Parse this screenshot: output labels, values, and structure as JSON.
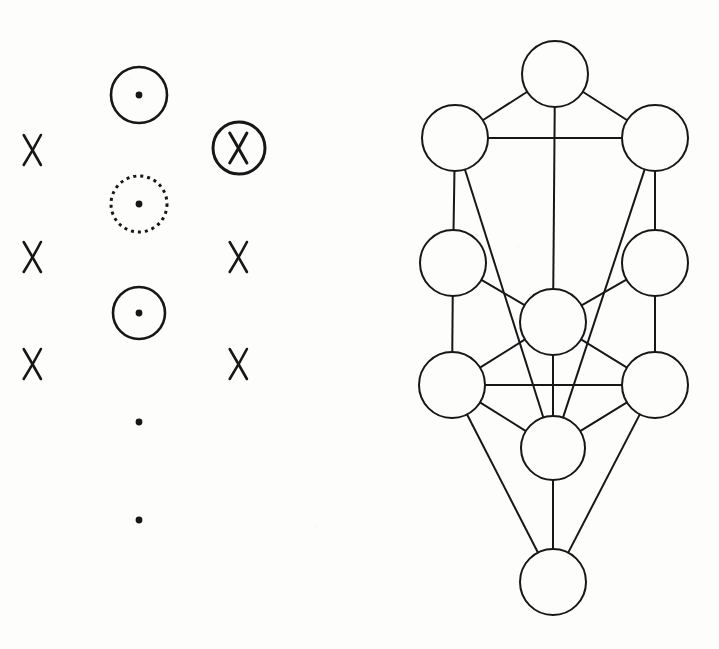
{
  "document": {
    "title": "Esoteric symbol column and Tree of Life diagram",
    "background_color": "#fdfdfb",
    "ink_color": "#17171a",
    "width": 719,
    "height": 649
  },
  "left_panel": {
    "name": "symbol-column-panel",
    "description": "Three vertical columns of alchemical / astrological style marks",
    "columns": [
      {
        "name": "left-column",
        "x": 33,
        "symbols": [
          {
            "kind": "x-mark",
            "label": "X",
            "x": 33,
            "y": 150,
            "size": 15,
            "stroke_width": 2.6
          },
          {
            "kind": "x-mark",
            "label": "X",
            "x": 33,
            "y": 257,
            "size": 15,
            "stroke_width": 2.6
          },
          {
            "kind": "x-mark",
            "label": "X",
            "x": 33,
            "y": 364,
            "size": 15,
            "stroke_width": 2.6
          }
        ]
      },
      {
        "name": "middle-column",
        "x": 139,
        "symbols": [
          {
            "kind": "circle-dot",
            "label": "circled point",
            "x": 139,
            "y": 95,
            "radius": 28,
            "stroke_width": 2.6,
            "dash": "none",
            "dot_radius": 3.4
          },
          {
            "kind": "circle-dot-dashed",
            "label": "dashed circled point",
            "x": 139,
            "y": 204,
            "radius": 28,
            "stroke_width": 3.0,
            "dash": "3 4",
            "dot_radius": 3.4
          },
          {
            "kind": "circle-dot",
            "label": "circled point",
            "x": 139,
            "y": 313,
            "radius": 26,
            "stroke_width": 2.6,
            "dash": "none",
            "dot_radius": 3.4
          },
          {
            "kind": "dot",
            "label": "point",
            "x": 139,
            "y": 422,
            "dot_radius": 3.4
          },
          {
            "kind": "dot",
            "label": "point",
            "x": 139,
            "y": 520,
            "dot_radius": 3.4
          }
        ]
      },
      {
        "name": "right-column",
        "x": 239,
        "symbols": [
          {
            "kind": "circled-x",
            "label": "X in circle",
            "x": 239,
            "y": 148,
            "radius": 26,
            "stroke_width": 3.0,
            "size": 15
          },
          {
            "kind": "x-mark",
            "label": "X",
            "x": 239,
            "y": 257,
            "size": 15,
            "stroke_width": 2.6
          },
          {
            "kind": "x-mark",
            "label": "X",
            "x": 239,
            "y": 364,
            "size": 15,
            "stroke_width": 2.6
          }
        ]
      }
    ]
  },
  "right_panel": {
    "name": "tree-of-life-panel",
    "description": "Kabbalistic Tree of Life: eleven circular nodes linked by straight paths",
    "node_stroke_width": 2.0,
    "path_stroke_width": 2.0,
    "nodes": [
      {
        "id": "n1",
        "name": "node-top-center",
        "cx": 555,
        "cy": 74,
        "r": 33
      },
      {
        "id": "n2",
        "name": "node-upper-left",
        "cx": 455,
        "cy": 138,
        "r": 33
      },
      {
        "id": "n3",
        "name": "node-upper-right",
        "cx": 655,
        "cy": 138,
        "r": 33
      },
      {
        "id": "n4",
        "name": "node-middle-left",
        "cx": 453,
        "cy": 263,
        "r": 33
      },
      {
        "id": "n5",
        "name": "node-middle-right",
        "cx": 655,
        "cy": 263,
        "r": 33
      },
      {
        "id": "n6",
        "name": "node-center",
        "cx": 553,
        "cy": 322,
        "r": 33
      },
      {
        "id": "n7",
        "name": "node-lower-left",
        "cx": 452,
        "cy": 385,
        "r": 33
      },
      {
        "id": "n8",
        "name": "node-lower-right",
        "cx": 655,
        "cy": 385,
        "r": 33
      },
      {
        "id": "n9",
        "name": "node-lower-center",
        "cx": 553,
        "cy": 448,
        "r": 32
      },
      {
        "id": "n10",
        "name": "node-bottom",
        "cx": 553,
        "cy": 582,
        "r": 33
      }
    ],
    "edges": [
      {
        "name": "path-top-to-upper-left",
        "from": "n1",
        "to": "n2"
      },
      {
        "name": "path-top-to-upper-right",
        "from": "n1",
        "to": "n3"
      },
      {
        "name": "path-top-to-center",
        "from": "n1",
        "to": "n6"
      },
      {
        "name": "path-upper-left-to-upper-right",
        "from": "n2",
        "to": "n3"
      },
      {
        "name": "path-upper-left-to-middle-left",
        "from": "n2",
        "to": "n4"
      },
      {
        "name": "path-upper-left-to-lower-center",
        "from": "n2",
        "to": "n9"
      },
      {
        "name": "path-upper-right-to-middle-right",
        "from": "n3",
        "to": "n5"
      },
      {
        "name": "path-upper-right-to-lower-center",
        "from": "n3",
        "to": "n9"
      },
      {
        "name": "path-middle-left-to-center",
        "from": "n4",
        "to": "n6"
      },
      {
        "name": "path-middle-left-to-lower-left",
        "from": "n4",
        "to": "n7"
      },
      {
        "name": "path-middle-right-to-center",
        "from": "n5",
        "to": "n6"
      },
      {
        "name": "path-middle-right-to-lower-right",
        "from": "n5",
        "to": "n8"
      },
      {
        "name": "path-center-to-lower-left",
        "from": "n6",
        "to": "n7"
      },
      {
        "name": "path-center-to-lower-right",
        "from": "n6",
        "to": "n8"
      },
      {
        "name": "path-center-to-lower-center",
        "from": "n6",
        "to": "n9"
      },
      {
        "name": "path-lower-left-to-lower-right",
        "from": "n7",
        "to": "n8"
      },
      {
        "name": "path-lower-left-to-lower-center",
        "from": "n7",
        "to": "n9"
      },
      {
        "name": "path-lower-right-to-lower-center",
        "from": "n8",
        "to": "n9"
      },
      {
        "name": "path-lower-left-to-bottom",
        "from": "n7",
        "to": "n10"
      },
      {
        "name": "path-lower-right-to-bottom",
        "from": "n8",
        "to": "n10"
      },
      {
        "name": "path-lower-center-to-bottom",
        "from": "n9",
        "to": "n10"
      }
    ]
  }
}
